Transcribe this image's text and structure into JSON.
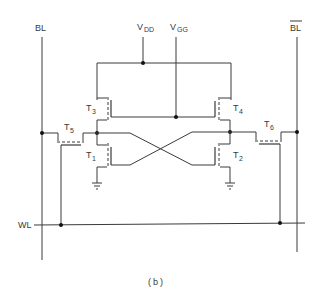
{
  "figure": {
    "caption": "(b)",
    "type": "6T SRAM cell schematic"
  },
  "labels": {
    "bl": "BL",
    "bl_bar": "BL",
    "wl": "WL",
    "vdd_main": "V",
    "vdd_sub": "DD",
    "vgg_main": "V",
    "vgg_sub": "GG",
    "t1_main": "T",
    "t1_sub": "1",
    "t2_main": "T",
    "t2_sub": "2",
    "t3_main": "T",
    "t3_sub": "3",
    "t4_main": "T",
    "t4_sub": "4",
    "t5_main": "T",
    "t5_sub": "5",
    "t6_main": "T",
    "t6_sub": "6"
  },
  "colors": {
    "line": "#3a3a3a",
    "node": "#111111",
    "background": "#ffffff"
  }
}
